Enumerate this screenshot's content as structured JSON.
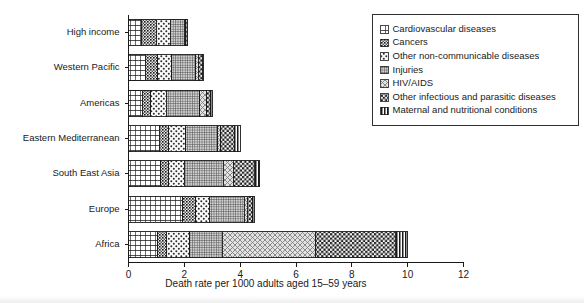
{
  "chart_data": {
    "type": "bar",
    "orientation": "horizontal",
    "stacked": true,
    "title": "",
    "xlabel": "Death rate per 1000 adults aged 15–59 years",
    "ylabel": "",
    "xlim": [
      0,
      12
    ],
    "xticks": [
      0,
      2,
      4,
      6,
      8,
      10,
      12
    ],
    "xtick_labels": [
      "0",
      "2",
      "4",
      "6",
      "8",
      "10",
      "12"
    ],
    "grid": false,
    "legend_position": "upper right",
    "categories": [
      "High income",
      "Western Pacific",
      "Americas",
      "Eastern Mediterranean",
      "South East Asia",
      "Europe",
      "Africa"
    ],
    "series": [
      {
        "name": "Cardiovascular diseases",
        "pattern": "grid-cross",
        "values": [
          0.45,
          0.6,
          0.5,
          1.1,
          1.15,
          1.95,
          1.05
        ]
      },
      {
        "name": "Cancers",
        "pattern": "dense-dot-grid",
        "values": [
          0.55,
          0.45,
          0.3,
          0.35,
          0.3,
          0.45,
          0.3
        ]
      },
      {
        "name": "Other non-communicable diseases",
        "pattern": "sparse-dots",
        "values": [
          0.5,
          0.5,
          0.55,
          0.6,
          0.55,
          0.5,
          0.85
        ]
      },
      {
        "name": "Injuries",
        "pattern": "fine-hatch-grid",
        "values": [
          0.5,
          0.85,
          1.2,
          1.15,
          1.4,
          1.25,
          1.15
        ]
      },
      {
        "name": "HIV/AIDS",
        "pattern": "diag-cross-light",
        "values": [
          0.05,
          0.1,
          0.25,
          0.1,
          0.35,
          0.1,
          3.35
        ]
      },
      {
        "name": "Other infectious and parasitic diseases",
        "pattern": "checker",
        "values": [
          0.05,
          0.15,
          0.15,
          0.5,
          0.75,
          0.2,
          2.85
        ]
      },
      {
        "name": "Maternal and nutritional conditions",
        "pattern": "vertical-lines",
        "values": [
          0.03,
          0.05,
          0.05,
          0.2,
          0.2,
          0.05,
          0.45
        ]
      }
    ],
    "totals": [
      2.13,
      2.7,
      3.0,
      4.0,
      4.7,
      4.5,
      10.0
    ]
  },
  "legend": {
    "items": [
      {
        "label": "Cardiovascular diseases"
      },
      {
        "label": "Cancers"
      },
      {
        "label": "Other non-communicable diseases"
      },
      {
        "label": "Injuries"
      },
      {
        "label": "HIV/AIDS"
      },
      {
        "label": "Other infectious and parasitic diseases"
      },
      {
        "label": "Maternal and nutritional conditions"
      }
    ]
  },
  "colors": {
    "ink": "#1a1a1a",
    "background": "#ffffff",
    "pattern_fill_light": "#f2f2f2",
    "pattern_fill_mid": "#cccccc"
  }
}
